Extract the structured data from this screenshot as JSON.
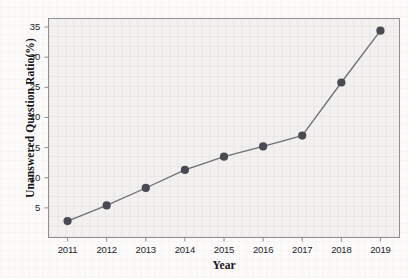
{
  "chart_data": {
    "type": "line",
    "title": "",
    "xlabel": "Year",
    "ylabel": "Unanswered Question Ratio(%)",
    "categories": [
      "2011",
      "2012",
      "2013",
      "2014",
      "2015",
      "2016",
      "2017",
      "2018",
      "2019"
    ],
    "x": [
      2011,
      2012,
      2013,
      2014,
      2015,
      2016,
      2017,
      2018,
      2019
    ],
    "values": [
      2.8,
      5.4,
      8.3,
      11.3,
      13.5,
      15.2,
      17.0,
      25.8,
      34.4
    ],
    "series": [
      {
        "name": "Unanswered Question Ratio",
        "values": [
          2.8,
          5.4,
          8.3,
          11.3,
          13.5,
          15.2,
          17.0,
          25.8,
          34.4
        ]
      }
    ],
    "ylim": [
      0,
      36.5
    ],
    "xlim": [
      2010.5,
      2019.5
    ],
    "yticks": [
      5,
      10,
      15,
      20,
      25,
      30,
      35
    ],
    "ytick_labels": [
      "5",
      "10",
      "15",
      "20",
      "25",
      "30",
      "35"
    ],
    "xticks": [
      2011,
      2012,
      2013,
      2014,
      2015,
      2016,
      2017,
      2018,
      2019
    ],
    "xtick_labels": [
      "2011",
      "2012",
      "2013",
      "2014",
      "2015",
      "2016",
      "2017",
      "2018",
      "2019"
    ],
    "grid": false,
    "legend": false,
    "legend_position": "none",
    "marker": "circle",
    "marker_color": "#4a4a52",
    "line_color": "#6e6e78",
    "plot_background": "#f2f1ef",
    "axis_color": "#8d8d92"
  }
}
